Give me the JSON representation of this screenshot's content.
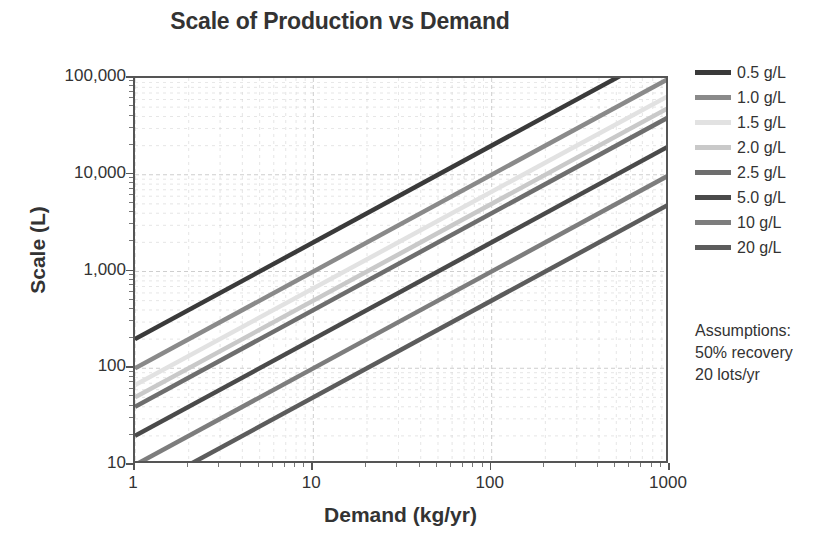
{
  "chart_data": {
    "type": "line",
    "title": "Scale of Production vs Demand",
    "xlabel": "Demand (kg/yr)",
    "ylabel": "Scale (L)",
    "xscale": "log",
    "yscale": "log",
    "xlim": [
      1,
      1000
    ],
    "ylim": [
      10,
      100000
    ],
    "xticks": [
      "1",
      "10",
      "100",
      "1000"
    ],
    "xtick_values": [
      1,
      10,
      100,
      1000
    ],
    "yticks": [
      "10",
      "100",
      "1,000",
      "10,000",
      "100,000"
    ],
    "ytick_values": [
      10,
      100,
      1000,
      10000,
      100000
    ],
    "grid": true,
    "grid_minor": true,
    "legend_position": "right",
    "series": [
      {
        "name": "0.5 g/L",
        "titer": 0.5,
        "color": "#3a3a3a",
        "x": [
          1,
          1000
        ],
        "y": [
          200,
          200000
        ]
      },
      {
        "name": "1.0 g/L",
        "titer": 1.0,
        "color": "#8a8a8a",
        "x": [
          1,
          1000
        ],
        "y": [
          100,
          100000
        ]
      },
      {
        "name": "1.5 g/L",
        "titer": 1.5,
        "color": "#e2e2e2",
        "x": [
          1,
          1000
        ],
        "y": [
          67,
          66700
        ]
      },
      {
        "name": "2.0 g/L",
        "titer": 2.0,
        "color": "#c9c9c9",
        "x": [
          1,
          1000
        ],
        "y": [
          50,
          50000
        ]
      },
      {
        "name": "2.5 g/L",
        "titer": 2.5,
        "color": "#6e6e6e",
        "x": [
          1,
          1000
        ],
        "y": [
          40,
          40000
        ]
      },
      {
        "name": "5.0 g/L",
        "titer": 5.0,
        "color": "#4a4a4a",
        "x": [
          1,
          1000
        ],
        "y": [
          20,
          20000
        ]
      },
      {
        "name": "10 g/L",
        "titer": 10,
        "color": "#7d7d7d",
        "x": [
          1,
          1000
        ],
        "y": [
          10,
          10000
        ]
      },
      {
        "name": "20 g/L",
        "titer": 20,
        "color": "#5c5c5c",
        "x": [
          2,
          1000
        ],
        "y": [
          10,
          5000
        ]
      }
    ]
  },
  "assumptions": {
    "heading": "Assumptions:",
    "lines": [
      "50% recovery",
      "20 lots/yr"
    ]
  },
  "colors": {
    "axis": "#555555",
    "grid": "#cccccc",
    "text": "#333333",
    "background": "#ffffff"
  }
}
